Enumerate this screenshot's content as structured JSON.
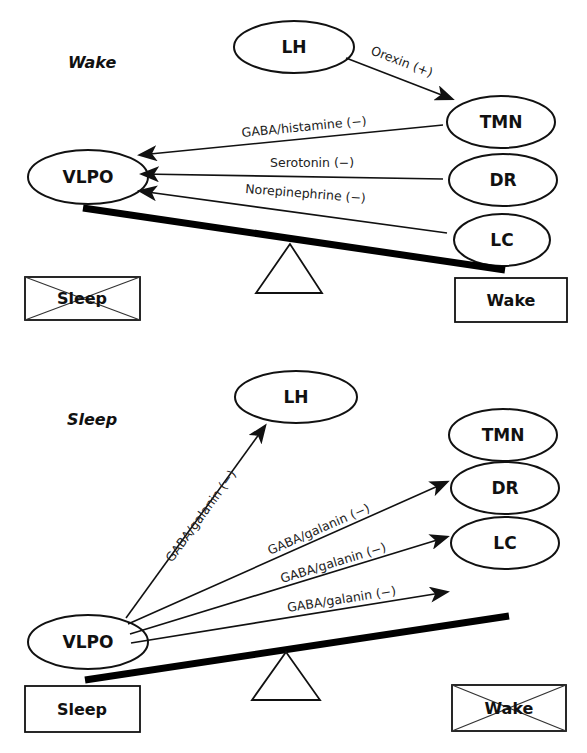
{
  "panels": {
    "wake": {
      "title": "Wake",
      "nodes": {
        "lh": "LH",
        "tmn": "TMN",
        "dr": "DR",
        "lc": "LC",
        "vlpo": "VLPO"
      },
      "edges": [
        {
          "from": "LH",
          "to": "TMN",
          "label": "Orexin (+)"
        },
        {
          "from": "TMN",
          "to": "VLPO",
          "label": "GABA/histamine (−)"
        },
        {
          "from": "DR",
          "to": "VLPO",
          "label": "Serotonin (−)"
        },
        {
          "from": "LC",
          "to": "VLPO",
          "label": "Norepinephrine (−)"
        }
      ],
      "boxes": {
        "left": {
          "label": "Sleep",
          "crossed": true
        },
        "right": {
          "label": "Wake",
          "crossed": false
        }
      },
      "seesaw_tilt": "down-right (Wake side heavier)"
    },
    "sleep": {
      "title": "Sleep",
      "nodes": {
        "lh": "LH",
        "tmn": "TMN",
        "dr": "DR",
        "lc": "LC",
        "vlpo": "VLPO"
      },
      "edges": [
        {
          "from": "VLPO",
          "to": "LH",
          "label": "GABA/galanin (−)"
        },
        {
          "from": "VLPO",
          "to": "TMN",
          "label": "GABA/galanin (−)"
        },
        {
          "from": "VLPO",
          "to": "DR",
          "label": "GABA/galanin (−)"
        },
        {
          "from": "VLPO",
          "to": "LC",
          "label": "GABA/galanin (−)"
        }
      ],
      "boxes": {
        "left": {
          "label": "Sleep",
          "crossed": false
        },
        "right": {
          "label": "Wake",
          "crossed": true
        }
      },
      "seesaw_tilt": "down-left (Sleep side heavier)"
    }
  },
  "colors": {
    "stroke": "#111111",
    "background": "#ffffff"
  }
}
